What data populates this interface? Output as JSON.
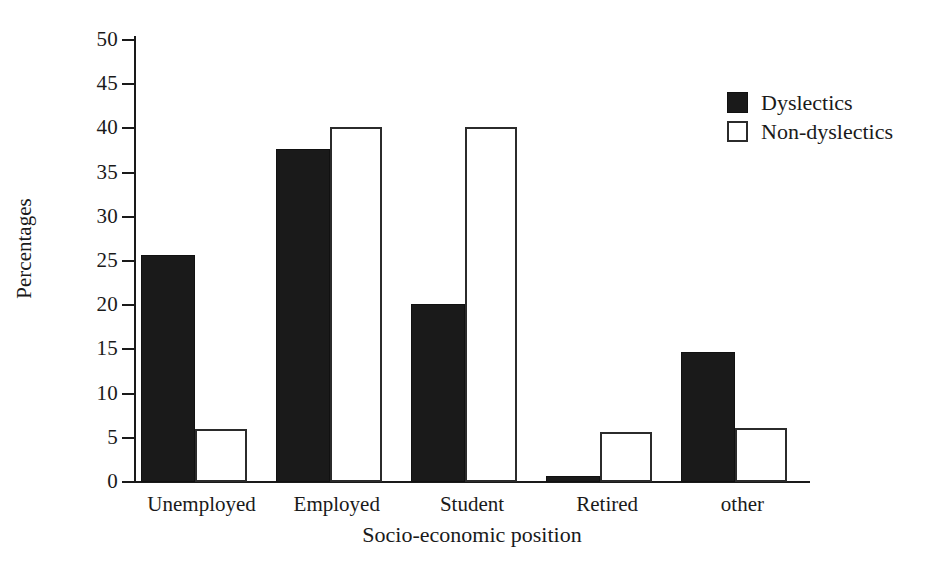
{
  "chart_data": {
    "type": "bar",
    "title": "",
    "xlabel": "Socio-economic position",
    "ylabel": "Percentages",
    "categories": [
      "Unemployed",
      "Employed",
      "Student",
      "Retired",
      "other"
    ],
    "series": [
      {
        "name": "Dyslectics",
        "values": [
          25.4,
          37.4,
          19.9,
          0.5,
          14.5
        ],
        "color": "#1a1a1a",
        "fill": "solid-black"
      },
      {
        "name": "Non-dyslectics",
        "values": [
          6.0,
          40.2,
          40.2,
          5.7,
          6.1
        ],
        "color": "#ffffff",
        "fill": "open-outline"
      }
    ],
    "ylim": [
      0,
      50
    ],
    "yticks": [
      0,
      5,
      10,
      15,
      20,
      25,
      30,
      35,
      40,
      45,
      50
    ],
    "ytick_labels": [
      "0",
      "5",
      "10",
      "15",
      "20",
      "25",
      "30",
      "35",
      "40",
      "45",
      "50"
    ],
    "grid": false,
    "legend_position": "top-right",
    "background": "#ffffff"
  },
  "legend": {
    "entries": [
      {
        "label": "Dyslectics",
        "swatch": "filled-square"
      },
      {
        "label": "Non-dyslectics",
        "swatch": "open-square"
      }
    ]
  },
  "axes": {
    "y_title": "Percentages",
    "x_title": "Socio-economic position"
  }
}
